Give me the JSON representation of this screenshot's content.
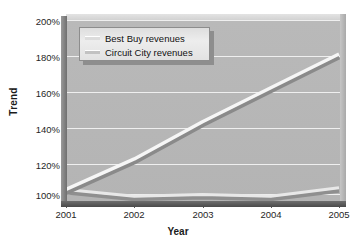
{
  "figure": {
    "title_clipped": "",
    "background": "#ffffff",
    "plot_background": "#b6b6b6",
    "gridline_color": "#efefef"
  },
  "legend": {
    "position": "top-left-inside",
    "entries": [
      {
        "label": "Best Buy revenues",
        "color": "#f2f2f2",
        "key": "best-buy"
      },
      {
        "label": "Circuit City revenues",
        "color": "#d0d0d0",
        "key": "circuit-city"
      }
    ]
  },
  "axes": {
    "y": {
      "label": "Trend",
      "ticks": [
        "200%",
        "180%",
        "160%",
        "140%",
        "120%",
        "100%"
      ]
    },
    "x": {
      "label": "Year",
      "ticks": [
        "2001",
        "2002",
        "2003",
        "2004",
        "2005"
      ]
    }
  },
  "chart_data": {
    "type": "line",
    "title": "",
    "xlabel": "Year",
    "ylabel": "Trend",
    "categories": [
      "2001",
      "2002",
      "2003",
      "2004",
      "2005"
    ],
    "x": [
      2001,
      2002,
      2003,
      2004,
      2005
    ],
    "ylim": [
      92,
      200
    ],
    "yticks": [
      100,
      120,
      140,
      160,
      180,
      200
    ],
    "ytick_labels": [
      "100%",
      "120%",
      "140%",
      "160%",
      "180%",
      "200%"
    ],
    "ytick_format": "percent",
    "grid": true,
    "legend_position": "upper left",
    "series": [
      {
        "name": "Best Buy revenues",
        "color": "#f2f2f2",
        "values": [
          100,
          118,
          140,
          160,
          180
        ]
      },
      {
        "name": "Circuit City revenues",
        "color": "#d0d0d0",
        "values": [
          100,
          96,
          97,
          96,
          101
        ]
      }
    ]
  }
}
